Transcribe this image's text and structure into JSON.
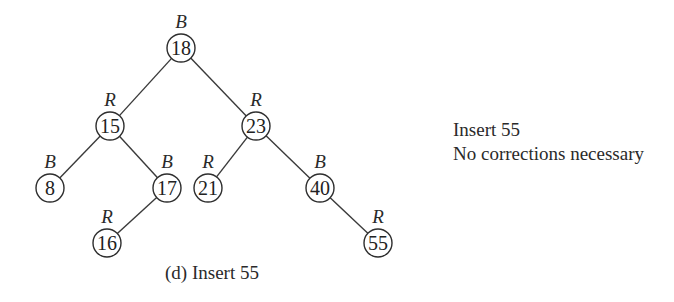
{
  "diagram": {
    "type": "red-black-tree",
    "nodes": [
      {
        "id": "n18",
        "key": "18",
        "color": "B",
        "x": 181,
        "y": 48
      },
      {
        "id": "n15",
        "key": "15",
        "color": "R",
        "x": 110,
        "y": 126
      },
      {
        "id": "n23",
        "key": "23",
        "color": "R",
        "x": 256,
        "y": 126
      },
      {
        "id": "n8",
        "key": "8",
        "color": "B",
        "x": 50,
        "y": 188
      },
      {
        "id": "n17",
        "key": "17",
        "color": "B",
        "x": 167,
        "y": 188
      },
      {
        "id": "n21",
        "key": "21",
        "color": "R",
        "x": 208,
        "y": 188
      },
      {
        "id": "n40",
        "key": "40",
        "color": "B",
        "x": 320,
        "y": 188
      },
      {
        "id": "n16",
        "key": "16",
        "color": "R",
        "x": 107,
        "y": 243
      },
      {
        "id": "n55",
        "key": "55",
        "color": "R",
        "x": 378,
        "y": 243
      }
    ],
    "edges": [
      {
        "from": "n18",
        "to": "n15"
      },
      {
        "from": "n18",
        "to": "n23"
      },
      {
        "from": "n15",
        "to": "n8"
      },
      {
        "from": "n15",
        "to": "n17"
      },
      {
        "from": "n23",
        "to": "n21"
      },
      {
        "from": "n23",
        "to": "n40"
      },
      {
        "from": "n17",
        "to": "n16"
      },
      {
        "from": "n40",
        "to": "n55"
      }
    ],
    "node_radius": 14
  },
  "note": {
    "line1": "Insert 55",
    "line2": "No corrections necessary"
  },
  "caption": "(d) Insert 55"
}
